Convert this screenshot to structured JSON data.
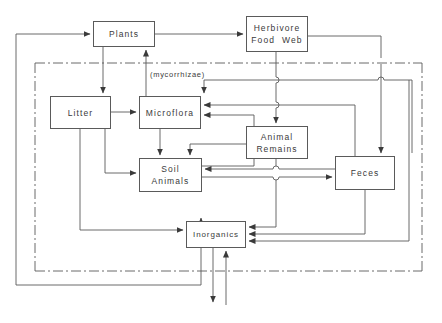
{
  "diagram": {
    "background_color": "#ffffff",
    "line_color": "#5a5a5a",
    "text_color": "#3a3a3a",
    "width": 442,
    "height": 323,
    "nodes": [
      {
        "id": "plants",
        "label": "Plants",
        "line1": "Plants",
        "line2": "",
        "x": 93,
        "y": 21,
        "w": 62,
        "h": 26
      },
      {
        "id": "herbivore-food-web",
        "label": "Herbivore Food Web",
        "line1": "Herbivore",
        "line2": "Food  Web",
        "x": 246,
        "y": 16,
        "w": 62,
        "h": 36
      },
      {
        "id": "litter",
        "label": "Litter",
        "line1": "Litter",
        "line2": "",
        "x": 50,
        "y": 96,
        "w": 61,
        "h": 33
      },
      {
        "id": "microflora",
        "label": "Microflora",
        "line1": "Microflora",
        "line2": "",
        "x": 139,
        "y": 96,
        "w": 62,
        "h": 33
      },
      {
        "id": "animal-remains",
        "label": "Animal Remains",
        "line1": "Animal",
        "line2": "Remains",
        "x": 246,
        "y": 126,
        "w": 62,
        "h": 33
      },
      {
        "id": "soil-animals",
        "label": "Soil Animals",
        "line1": "Soil",
        "line2": "Animals",
        "x": 139,
        "y": 158,
        "w": 63,
        "h": 34
      },
      {
        "id": "feces",
        "label": "Feces",
        "line1": "Feces",
        "line2": "",
        "x": 335,
        "y": 156,
        "w": 60,
        "h": 34
      },
      {
        "id": "inorganics",
        "label": "Inorganics",
        "line1": "Inorganics",
        "line2": "",
        "x": 186,
        "y": 221,
        "w": 60,
        "h": 27
      }
    ],
    "annotations": [
      {
        "id": "mycorrhizae",
        "text": "(mycorrhizae)",
        "x": 150,
        "y": 70
      }
    ],
    "boundary": {
      "id": "soil-surface-boundary",
      "style": "dash-dot",
      "description": "dash-dot line enclosing the belowground compartment"
    }
  }
}
